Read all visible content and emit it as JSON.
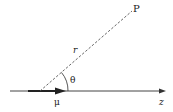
{
  "diagram": {
    "labels": {
      "point": "P",
      "radius": "r",
      "angle": "θ",
      "dipole": "μ",
      "axis": "z"
    },
    "colors": {
      "line": "#333333",
      "text": "#222222"
    }
  }
}
